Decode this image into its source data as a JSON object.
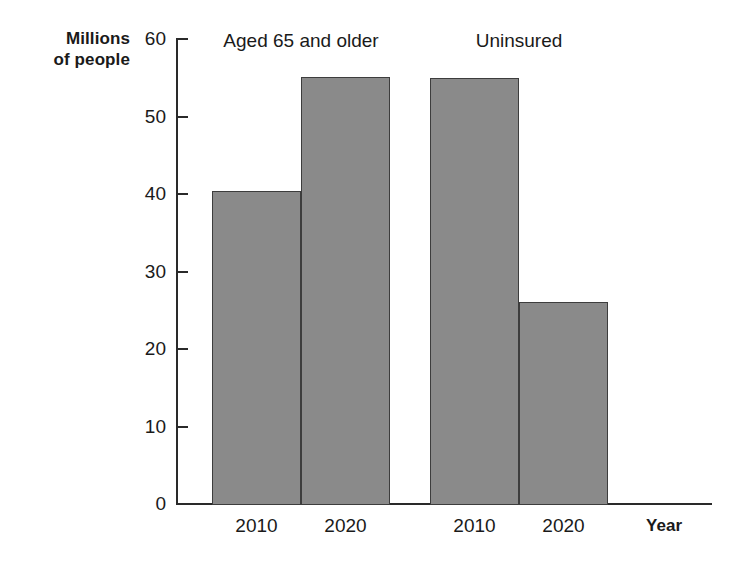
{
  "chart_data": {
    "type": "bar",
    "title": "",
    "subtitle": "",
    "xlabel": "Year",
    "ylabel": "Millions\nof people",
    "ylim": [
      0,
      60
    ],
    "ytick_labels": [
      "60",
      "50",
      "40",
      "30",
      "20",
      "10",
      "0"
    ],
    "ytick_values": [
      60,
      50,
      40,
      30,
      20,
      10,
      0
    ],
    "grid": false,
    "legend_position": "none",
    "categories": [
      "2010",
      "2020",
      "2010",
      "2020"
    ],
    "values": [
      40.3,
      55.0,
      54.8,
      26.0
    ],
    "bars": [
      {
        "category": "2010",
        "group": "Aged 65 and older",
        "value": 40.3
      },
      {
        "category": "2020",
        "group": "Aged 65 and older",
        "value": 55.0
      },
      {
        "category": "2010",
        "group": "Uninsured",
        "value": 54.8
      },
      {
        "category": "2020",
        "group": "Uninsured",
        "value": 26.0
      }
    ],
    "annotations": [
      {
        "text": "Aged 65 and older",
        "position": "above-group-1"
      },
      {
        "text": "Uninsured",
        "position": "above-group-2"
      }
    ],
    "colors": {
      "bar_fill": "#8a8a8a",
      "bar_stroke": "#3d3d3d",
      "axis": "#2a2a2a",
      "text": "#1a1a1a",
      "background": "#ffffff"
    }
  },
  "axes": {
    "y_title": "Millions\nof people",
    "x_title": "Year"
  },
  "ticks": {
    "y": [
      {
        "label": "60",
        "value": 60
      },
      {
        "label": "50",
        "value": 50
      },
      {
        "label": "40",
        "value": 40
      },
      {
        "label": "30",
        "value": 30
      },
      {
        "label": "20",
        "value": 20
      },
      {
        "label": "10",
        "value": 10
      },
      {
        "label": "0",
        "value": 0
      }
    ],
    "x": [
      {
        "label": "2010"
      },
      {
        "label": "2020"
      },
      {
        "label": "2010"
      },
      {
        "label": "2020"
      }
    ]
  },
  "groups": [
    {
      "label": "Aged 65 and older"
    },
    {
      "label": "Uninsured"
    }
  ]
}
